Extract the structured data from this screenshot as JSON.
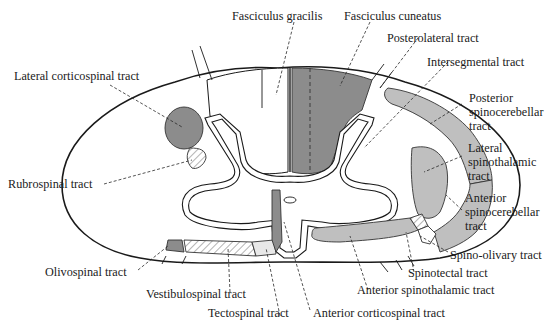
{
  "figure": {
    "colors": {
      "dark_fill": "#8c8c8c",
      "light_fill": "#bfbfbf",
      "line": "#1a1a1a",
      "background": "#ffffff"
    },
    "labels": {
      "fasciculus_gracilis": "Fasciculus gracilis",
      "fasciculus_cuneatus": "Fasciculus cuneatus",
      "posterolateral_tract": "Posterolateral tract",
      "intersegmental_tract": "Intersegmental tract",
      "posterior_spinocerebellar_1": "Posterior",
      "posterior_spinocerebellar_2": "spinocerebellar",
      "posterior_spinocerebellar_3": "tract",
      "lateral_spinothalamic_1": "Lateral",
      "lateral_spinothalamic_2": "spinothalamic",
      "lateral_spinothalamic_3": "tract",
      "anterior_spinocerebellar_1": "Anterior",
      "anterior_spinocerebellar_2": "spinocerebellar",
      "anterior_spinocerebellar_3": "tract",
      "spino_olivary_tract": "Spino-olivary tract",
      "spinotectal_tract": "Spinotectal tract",
      "anterior_spinothalamic_tract": "Anterior spinothalamic tract",
      "anterior_corticospinal_tract": "Anterior corticospinal tract",
      "tectospinal_tract": "Tectospinal tract",
      "vestibulospinal_tract": "Vestibulospinal tract",
      "olivospinal_tract": "Olivospinal tract",
      "rubrospinal_tract": "Rubrospinal tract",
      "lateral_corticospinal_tract": "Lateral corticospinal tract"
    },
    "caption_fragment": "Figure ..."
  }
}
